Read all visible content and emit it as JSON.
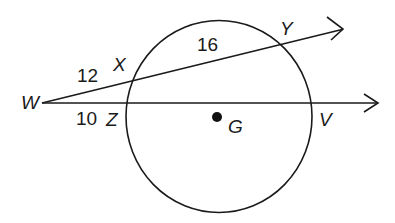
{
  "diagram": {
    "type": "circle-two-secants",
    "circle": {
      "center_label": "G",
      "center": [
        217,
        117
      ],
      "radius": 94
    },
    "external_point": {
      "label": "W",
      "position": [
        42,
        103
      ]
    },
    "secants": [
      {
        "name": "secant-WY",
        "points": [
          "W",
          "X",
          "Y"
        ],
        "external_segment": {
          "endpoints": [
            "W",
            "X"
          ],
          "length": "12"
        },
        "chord_segment": {
          "endpoints": [
            "X",
            "Y"
          ],
          "length": "16"
        }
      },
      {
        "name": "secant-WV",
        "points": [
          "W",
          "Z",
          "V"
        ],
        "external_segment": {
          "endpoints": [
            "W",
            "Z"
          ],
          "length": "10"
        },
        "chord_segment": {
          "endpoints": [
            "Z",
            "V"
          ],
          "length": ""
        }
      }
    ],
    "labels": {
      "W": "W",
      "X": "X",
      "Y": "Y",
      "Z": "Z",
      "V": "V",
      "G": "G",
      "WX": "12",
      "XY": "16",
      "WZ": "10"
    },
    "colors": {
      "stroke": "#1a1a1a",
      "background": "#ffffff"
    }
  }
}
